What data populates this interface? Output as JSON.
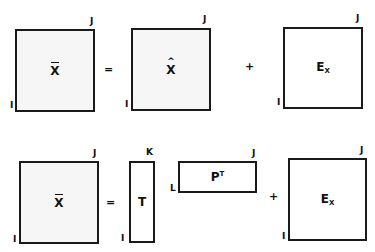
{
  "top_equation": {
    "lhs": {
      "symbol": "X",
      "decoration": "bar",
      "row_dim": "I",
      "col_dim": "J"
    },
    "equals": "=",
    "term1": {
      "symbol": "X",
      "decoration": "hat",
      "row_dim": "I",
      "col_dim": "J"
    },
    "plus": "+",
    "term2": {
      "symbol": "E",
      "subscript": "X",
      "row_dim": "I",
      "col_dim": "J"
    }
  },
  "bottom_equation": {
    "lhs": {
      "symbol": "X",
      "decoration": "bar",
      "row_dim": "I",
      "col_dim": "J"
    },
    "equals": "=",
    "scores": {
      "symbol": "T",
      "row_dim": "I",
      "col_dim": "K"
    },
    "loadings": {
      "symbol": "P",
      "superscript": "T",
      "row_dim": "L",
      "col_dim": "J"
    },
    "plus": "+",
    "residual": {
      "symbol": "E",
      "subscript": "X",
      "row_dim": "I",
      "col_dim": "J"
    }
  },
  "colors": {
    "border": "#1a1a1a",
    "shaded_fill": "#f6f6f6",
    "white_fill": "#ffffff"
  }
}
